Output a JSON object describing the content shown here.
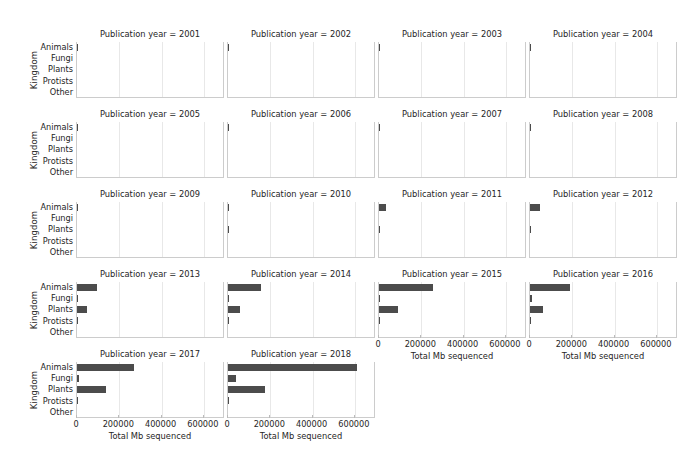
{
  "figure": {
    "facet_label_prefix": "Publication year =",
    "ylabel": "Kingdom",
    "xlabel": "Total Mb sequenced",
    "bar_color": "#4c4c4c",
    "grid_color": "#e8e8e8",
    "axis_color": "#cccccc",
    "categories": [
      "Animals",
      "Fungi",
      "Plants",
      "Protists",
      "Other"
    ],
    "xticks": [
      "0",
      "200000",
      "400000",
      "600000"
    ],
    "xtick_values": [
      0,
      200000,
      400000,
      600000
    ],
    "n_cols": 4,
    "n_rows": 5
  },
  "chart_data": {
    "type": "bar",
    "title": "",
    "xlabel": "Total Mb sequenced",
    "ylabel": "Kingdom",
    "orientation": "horizontal",
    "xlim": [
      0,
      700000
    ],
    "grid": true,
    "legend": "none",
    "facet_by": "Publication year",
    "categories": [
      "Animals",
      "Fungi",
      "Plants",
      "Protists",
      "Other"
    ],
    "facets": [
      {
        "year": 2001,
        "title": "Publication year = 2001",
        "values": [
          1200,
          0,
          0,
          0,
          0
        ]
      },
      {
        "year": 2002,
        "title": "Publication year = 2002",
        "values": [
          1500,
          0,
          0,
          0,
          0
        ]
      },
      {
        "year": 2003,
        "title": "Publication year = 2003",
        "values": [
          1800,
          0,
          0,
          0,
          0
        ]
      },
      {
        "year": 2004,
        "title": "Publication year = 2004",
        "values": [
          3200,
          0,
          0,
          0,
          0
        ]
      },
      {
        "year": 2005,
        "title": "Publication year = 2005",
        "values": [
          4200,
          0,
          0,
          0,
          0
        ]
      },
      {
        "year": 2006,
        "title": "Publication year = 2006",
        "values": [
          3800,
          0,
          0,
          0,
          0
        ]
      },
      {
        "year": 2007,
        "title": "Publication year = 2007",
        "values": [
          5200,
          0,
          0,
          0,
          0
        ]
      },
      {
        "year": 2008,
        "title": "Publication year = 2008",
        "values": [
          5500,
          0,
          0,
          0,
          0
        ]
      },
      {
        "year": 2009,
        "title": "Publication year = 2009",
        "values": [
          5000,
          0,
          0,
          0,
          0
        ]
      },
      {
        "year": 2010,
        "title": "Publication year = 2010",
        "values": [
          4000,
          0,
          2000,
          0,
          0
        ]
      },
      {
        "year": 2011,
        "title": "Publication year = 2011",
        "values": [
          33000,
          0,
          2500,
          0,
          0
        ]
      },
      {
        "year": 2012,
        "title": "Publication year = 2012",
        "values": [
          48000,
          0,
          5000,
          0,
          0
        ]
      },
      {
        "year": 2013,
        "title": "Publication year = 2013",
        "values": [
          95000,
          2000,
          48000,
          2000,
          0
        ]
      },
      {
        "year": 2014,
        "title": "Publication year = 2014",
        "values": [
          155000,
          3000,
          55000,
          1500,
          0
        ]
      },
      {
        "year": 2015,
        "title": "Publication year = 2015",
        "values": [
          255000,
          3000,
          90000,
          1500,
          0
        ]
      },
      {
        "year": 2016,
        "title": "Publication year = 2016",
        "values": [
          190000,
          8000,
          60000,
          1500,
          0
        ]
      },
      {
        "year": 2017,
        "title": "Publication year = 2017",
        "values": [
          270000,
          8000,
          135000,
          2000,
          0
        ]
      },
      {
        "year": 2018,
        "title": "Publication year = 2018",
        "values": [
          610000,
          37000,
          175000,
          2500,
          0
        ]
      }
    ]
  }
}
